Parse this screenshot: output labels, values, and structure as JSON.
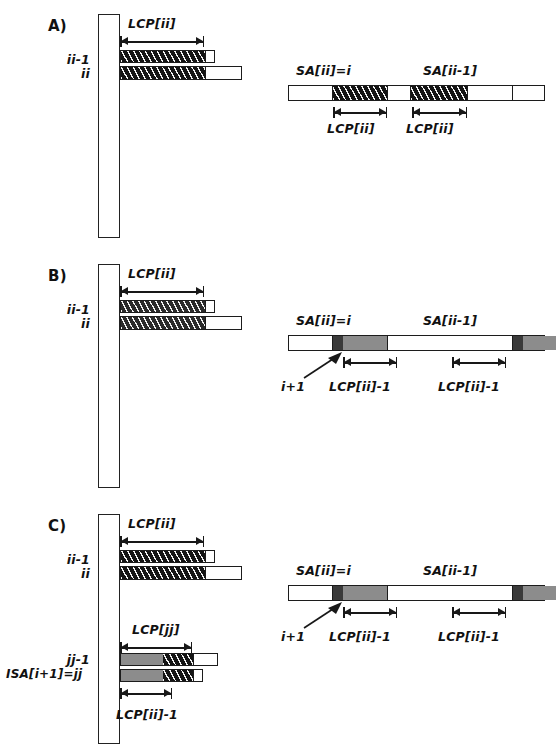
{
  "figure": {
    "panels": [
      {
        "id": "A",
        "letter": "A)",
        "left": {
          "row_labels": [
            "ii-1",
            "ii"
          ],
          "dimension_label": "LCP[ii]"
        },
        "right": {
          "label_left": "SA[ii]=i",
          "label_right": "SA[ii-1]",
          "dimension_left": "LCP[ii]",
          "dimension_right": "LCP[ii]"
        }
      },
      {
        "id": "B",
        "letter": "B)",
        "left": {
          "row_labels": [
            "ii-1",
            "ii"
          ],
          "dimension_label": "LCP[ii]"
        },
        "right": {
          "label_left": "SA[ii]=i",
          "label_right": "SA[ii-1]",
          "pointer_label": "i+1",
          "dimension_left": "LCP[ii]-1",
          "dimension_right": "LCP[ii]-1"
        }
      },
      {
        "id": "C",
        "letter": "C)",
        "left": {
          "row_labels": [
            "ii-1",
            "ii"
          ],
          "dimension_label": "LCP[ii]",
          "row_labels_lower": [
            "jj-1",
            "ISA[i+1]=jj"
          ],
          "dimension_label_lower": "LCP[jj]",
          "dimension_label_bottom": "LCP[ii]-1"
        },
        "right": {
          "label_left": "SA[ii]=i",
          "label_right": "SA[ii-1]",
          "pointer_label": "i+1",
          "dimension_left": "LCP[ii]-1",
          "dimension_right": "LCP[ii]-1"
        }
      }
    ],
    "colors": {
      "ink": "#1a1a1a",
      "hatch_fill": "#141414",
      "gray_fill": "#8c8c8c",
      "dark_square": "#3a3a3a",
      "paper": "#ffffff"
    }
  }
}
